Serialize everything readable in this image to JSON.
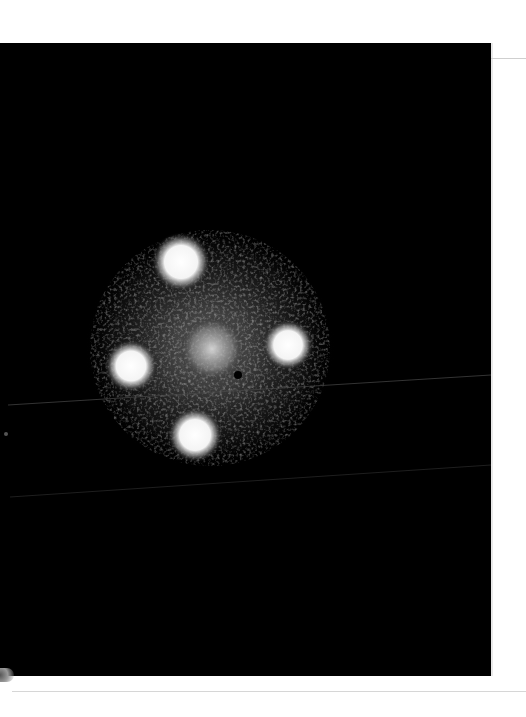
{
  "image": {
    "subject": "Four-image gravitational lens (Einstein Cross style) with central lensing galaxy",
    "alt": "Black astronomical image showing four bright blurred point sources arranged in a cross around a faint diffuse central glow",
    "background_color": "#000000",
    "page_color": "#ffffff",
    "sources": [
      {
        "name": "top",
        "cx": 181,
        "cy": 219,
        "r": 22
      },
      {
        "name": "left",
        "cx": 131,
        "cy": 323,
        "r": 20
      },
      {
        "name": "right",
        "cx": 288,
        "cy": 302,
        "r": 19
      },
      {
        "name": "bottom",
        "cx": 195,
        "cy": 392,
        "r": 21
      }
    ],
    "lens_galaxy": {
      "cx": 212,
      "cy": 306,
      "r": 32
    },
    "scan_lines": [
      {
        "x1": 8,
        "y1": 362,
        "x2": 491,
        "y2": 332
      },
      {
        "x1": 10,
        "y1": 454,
        "x2": 491,
        "y2": 422
      }
    ]
  }
}
